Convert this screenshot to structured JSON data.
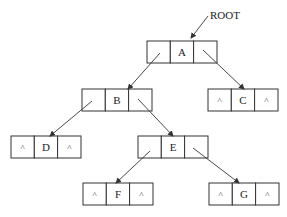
{
  "diagram": {
    "type": "binary-tree-linked-representation",
    "pointer_label": "ROOT",
    "null_symbol": "^",
    "nodes": [
      {
        "id": "A",
        "label": "A",
        "left": "B",
        "right": "C"
      },
      {
        "id": "B",
        "label": "B",
        "left": "D",
        "right": "E"
      },
      {
        "id": "C",
        "label": "C",
        "left": "^",
        "right": "^"
      },
      {
        "id": "D",
        "label": "D",
        "left": "^",
        "right": "^"
      },
      {
        "id": "E",
        "label": "E",
        "left": "F",
        "right": "G"
      },
      {
        "id": "F",
        "label": "F",
        "left": "^",
        "right": "^"
      },
      {
        "id": "G",
        "label": "G",
        "left": "^",
        "right": "^"
      }
    ],
    "edges": [
      [
        "ROOT",
        "A"
      ],
      [
        "A",
        "B"
      ],
      [
        "A",
        "C"
      ],
      [
        "B",
        "D"
      ],
      [
        "B",
        "E"
      ],
      [
        "E",
        "F"
      ],
      [
        "E",
        "G"
      ]
    ]
  }
}
